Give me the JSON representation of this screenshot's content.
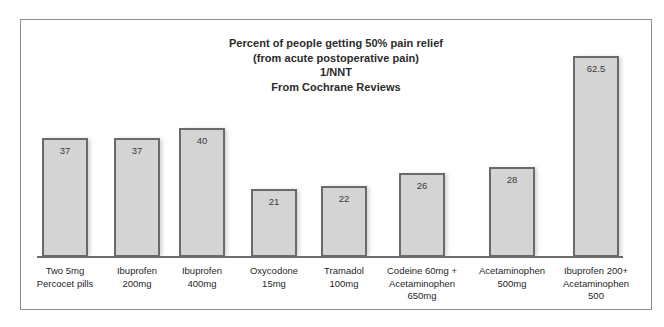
{
  "chart_data": {
    "type": "bar",
    "title": "Percent of people getting 50% pain relief\n(from acute postoperative pain)\n1/NNT\nFrom Cochrane Reviews",
    "title_lines": [
      "Percent of people getting 50% pain relief",
      "(from acute postoperative pain)",
      "1/NNT",
      "From Cochrane Reviews"
    ],
    "xlabel": "",
    "ylabel": "",
    "ylim": [
      0,
      70
    ],
    "grid": false,
    "legend": false,
    "categories": [
      "Two 5mg Percocet pills",
      "Ibuprofen 200mg",
      "Ibuprofen 400mg",
      "Oxycodone 15mg",
      "Tramadol 100mg",
      "Codeine 60mg + Acetaminophen 650mg",
      "Acetaminophen 500mg",
      "Ibuprofen 200+ Acetaminophen 500"
    ],
    "category_label_lines": [
      [
        "Two 5mg",
        "Percocet pills"
      ],
      [
        "Ibuprofen",
        "200mg"
      ],
      [
        "Ibuprofen",
        "400mg"
      ],
      [
        "Oxycodone",
        "15mg"
      ],
      [
        "Tramadol",
        "100mg"
      ],
      [
        "Codeine 60mg +",
        "Acetaminophen",
        "650mg"
      ],
      [
        "Acetaminophen",
        "500mg"
      ],
      [
        "Ibuprofen 200+",
        "Acetaminophen",
        "500"
      ]
    ],
    "values": [
      37,
      37,
      40,
      21,
      22,
      26,
      28,
      62.5
    ],
    "value_labels": [
      "37",
      "37",
      "40",
      "21",
      "22",
      "26",
      "28",
      "62.5"
    ],
    "colors": {
      "bar_fill": "#d4d4d4",
      "bar_border": "#6a6a6a",
      "axis_line": "#6d6d6d",
      "frame_border": "#8e8e8e",
      "title_text": "#2b2b2b",
      "label_text": "#1f1f1f",
      "value_text": "#3a3a3a"
    }
  }
}
